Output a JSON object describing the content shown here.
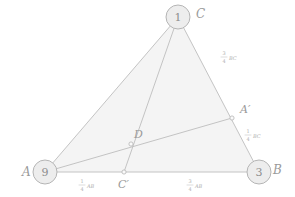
{
  "figure": {
    "type": "geometry-diagram",
    "colors": {
      "stroke": "#bdbdbd",
      "fill": "#f4f4f4",
      "text": "#9a9a9a",
      "small_text": "#b0b0b0",
      "vertex_circle_fill": "#ededed",
      "vertex_circle_stroke": "#b5b5b5"
    },
    "vertices": [
      {
        "id": "C",
        "label": "C",
        "number": "1",
        "x": 178,
        "y": 17,
        "label_x": 196,
        "label_y": 14
      },
      {
        "id": "A",
        "label": "A",
        "number": "9",
        "x": 45,
        "y": 172,
        "label_x": 22,
        "label_y": 172
      },
      {
        "id": "B",
        "label": "B",
        "number": "3",
        "x": 259,
        "y": 172,
        "label_x": 277,
        "label_y": 170
      }
    ],
    "points": [
      {
        "id": "A_prime",
        "label": "A′",
        "x": 232,
        "y": 118,
        "label_x": 240,
        "label_y": 109
      },
      {
        "id": "C_prime",
        "label": "C′",
        "x": 124,
        "y": 172,
        "label_x": 120,
        "label_y": 184
      },
      {
        "id": "D",
        "label": "D",
        "x": 131,
        "y": 144,
        "label_x": 134,
        "label_y": 134
      }
    ],
    "edges": [
      {
        "id": "AB",
        "from": "A",
        "to": "B"
      },
      {
        "id": "BC",
        "from": "B",
        "to": "C"
      },
      {
        "id": "CA",
        "from": "C",
        "to": "A"
      },
      {
        "id": "AA_prime",
        "from": "A",
        "to": "A_prime"
      },
      {
        "id": "CC_prime",
        "from": "C",
        "to": "C_prime"
      }
    ],
    "measure_labels": [
      {
        "id": "three-quarter-bc",
        "numerator": "3",
        "denominator": "4",
        "segment": "BC",
        "x": 224,
        "y": 57
      },
      {
        "id": "one-quarter-bc",
        "numerator": "1",
        "denominator": "4",
        "segment": "BC",
        "x": 248,
        "y": 135
      },
      {
        "id": "one-quarter-ab",
        "numerator": "1",
        "denominator": "4",
        "segment": "AB",
        "x": 82,
        "y": 185
      },
      {
        "id": "three-quarter-ab",
        "numerator": "3",
        "denominator": "4",
        "segment": "AB",
        "x": 190,
        "y": 185
      }
    ]
  }
}
